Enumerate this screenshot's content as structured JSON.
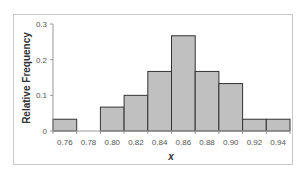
{
  "chart_data": {
    "type": "bar",
    "subtype": "histogram",
    "title": "",
    "xlabel": "x",
    "ylabel": "Relative Frequency",
    "categories": [
      "0.76",
      "0.78",
      "0.80",
      "0.82",
      "0.84",
      "0.86",
      "0.88",
      "0.90",
      "0.92",
      "0.94"
    ],
    "values": [
      0.033,
      0,
      0.067,
      0.1,
      0.167,
      0.267,
      0.167,
      0.133,
      0.033,
      0.033
    ],
    "ylim": [
      0,
      0.3
    ],
    "yticks": [
      "0",
      "0.1",
      "0.2",
      "0.3"
    ],
    "ytick_values": [
      0,
      0.1,
      0.2,
      0.3
    ],
    "grid": false,
    "legend": null,
    "bar_fill": "#c0c0c0",
    "bar_stroke": "#333333"
  }
}
